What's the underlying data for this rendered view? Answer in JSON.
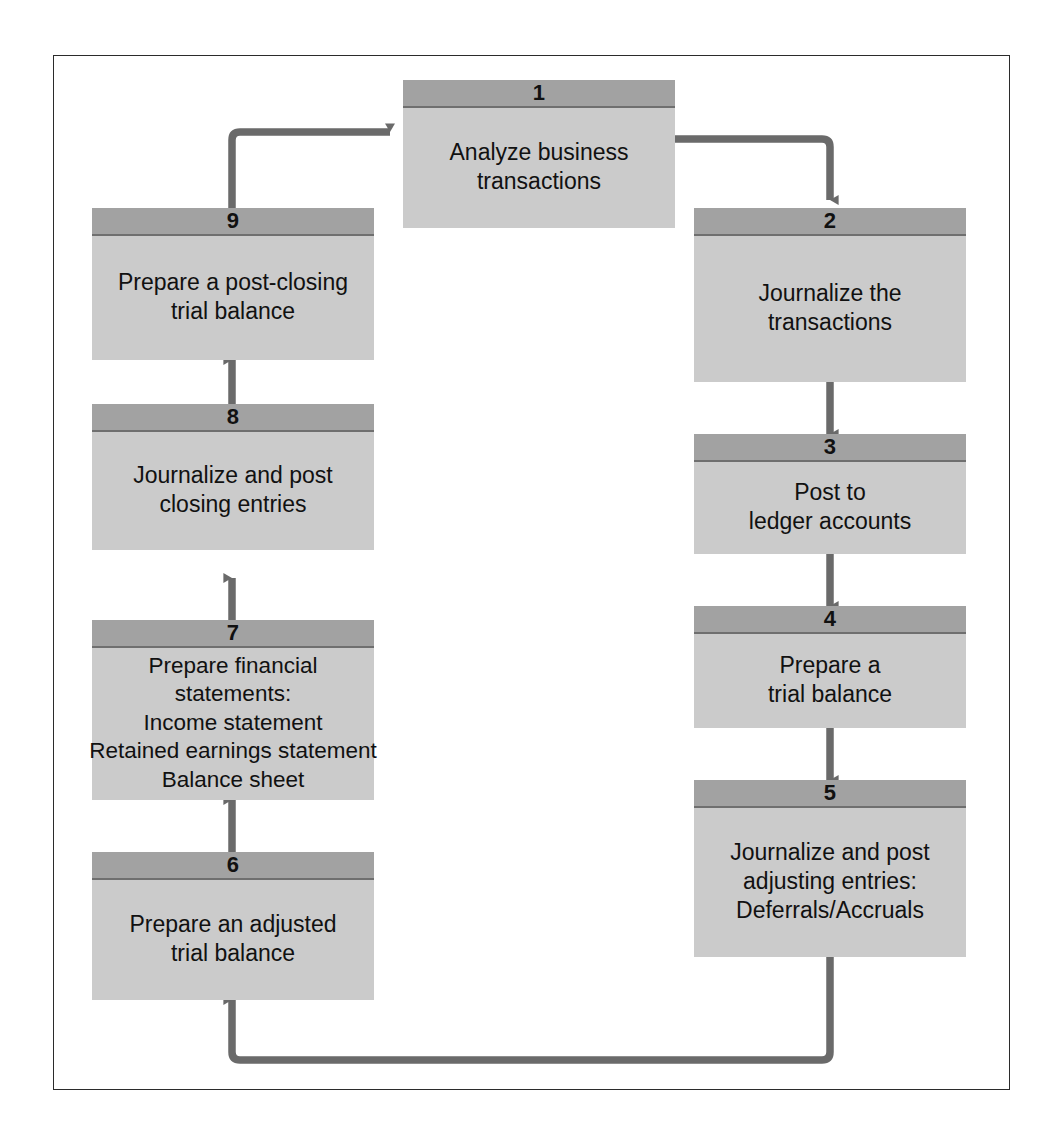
{
  "diagram": {
    "colors": {
      "header_fill": "#a2a2a2",
      "body_fill": "#cbcbcb",
      "divider": "#6f6f6f",
      "connector": "#6a6a6a",
      "frame_border": "#2b2b2b",
      "text": "#111111",
      "background": "#ffffff"
    },
    "steps": [
      {
        "number": "1",
        "label": "Analyze business\ntransactions"
      },
      {
        "number": "2",
        "label": "Journalize the\ntransactions"
      },
      {
        "number": "3",
        "label": "Post to\nledger accounts"
      },
      {
        "number": "4",
        "label": "Prepare a\ntrial balance"
      },
      {
        "number": "5",
        "label": "Journalize and post\nadjusting entries:\nDeferrals/Accruals"
      },
      {
        "number": "6",
        "label": "Prepare an adjusted\ntrial balance"
      },
      {
        "number": "7",
        "label": "Prepare financial\nstatements:\nIncome statement\nRetained earnings statement\nBalance sheet"
      },
      {
        "number": "8",
        "label": "Journalize and post\nclosing entries"
      },
      {
        "number": "9",
        "label": "Prepare a post-closing\ntrial balance"
      }
    ],
    "connectors": [
      {
        "name": "step-1-to-step-2",
        "from": "1",
        "to": "2",
        "direction": "down"
      },
      {
        "name": "step-2-to-step-3",
        "from": "2",
        "to": "3",
        "direction": "down"
      },
      {
        "name": "step-3-to-step-4",
        "from": "3",
        "to": "4",
        "direction": "down"
      },
      {
        "name": "step-4-to-step-5",
        "from": "4",
        "to": "5",
        "direction": "down"
      },
      {
        "name": "step-5-to-step-6",
        "from": "5",
        "to": "6",
        "direction": "up"
      },
      {
        "name": "step-6-to-step-7",
        "from": "6",
        "to": "7",
        "direction": "up"
      },
      {
        "name": "step-7-to-step-8",
        "from": "7",
        "to": "8",
        "direction": "up"
      },
      {
        "name": "step-8-to-step-9",
        "from": "8",
        "to": "9",
        "direction": "up"
      },
      {
        "name": "step-9-to-step-1",
        "from": "9",
        "to": "1",
        "direction": "right"
      }
    ]
  }
}
